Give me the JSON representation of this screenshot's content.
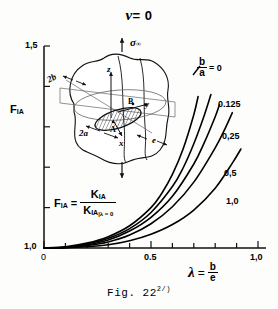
{
  "title_symbol": "ν",
  "title_rest": "= 0",
  "caption": "Fig. 22",
  "caption_superscript": "2/)",
  "axes": {
    "y_label": "F",
    "y_label_sub": "IA",
    "y_top_tick": "1,5",
    "y_bottom_tick": "1,0",
    "x_zero_tick": "0",
    "x_half_tick": "0.5",
    "x_one_tick": "1,0",
    "x_label_symbol": "λ",
    "x_label_eq": "=",
    "x_label_num": "b",
    "x_label_den": "e"
  },
  "formula": {
    "lhs": "F",
    "lhs_sub": "IA",
    "eq": "=",
    "num": "K",
    "num_sub": "IA",
    "den": "K",
    "den_sub": "IA",
    "den_cond": "λ = 0"
  },
  "curve_legend": {
    "ratio_num": "b",
    "ratio_den": "a",
    "ratio_eq": "= 0"
  },
  "inset": {
    "sigma": "σ",
    "sigma_sub": "∞",
    "label_2b": "2b",
    "label_2a": "2a",
    "label_e": "e",
    "label_x": "x",
    "label_y": "y",
    "label_z": "z",
    "point_a": "A",
    "point_b": "B"
  },
  "chart_data": {
    "type": "line",
    "xlabel": "λ = b/e",
    "ylabel": "F_IA",
    "xlim": [
      0,
      1.0
    ],
    "ylim": [
      1.0,
      1.5
    ],
    "grid": false,
    "legend_position": "inline-right",
    "x_ticks": [
      0,
      0.1,
      0.2,
      0.3,
      0.4,
      0.5,
      0.6,
      0.7,
      0.8,
      0.9,
      1.0
    ],
    "x_tick_labels": [
      "0",
      "",
      "",
      "",
      "",
      "0.5",
      "",
      "",
      "",
      "",
      "1,0"
    ],
    "y_ticks": [
      1.0,
      1.1,
      1.2,
      1.3,
      1.4,
      1.5
    ],
    "y_tick_labels": [
      "1,0",
      "",
      "",
      "",
      "",
      "1,5"
    ],
    "series": [
      {
        "name": "b/a = 0",
        "label": "0",
        "x": [
          0,
          0.1,
          0.2,
          0.3,
          0.4,
          0.5,
          0.55,
          0.6,
          0.65,
          0.7,
          0.72
        ],
        "values": [
          1.0,
          1.003,
          1.012,
          1.028,
          1.055,
          1.1,
          1.135,
          1.182,
          1.245,
          1.33,
          1.375
        ]
      },
      {
        "name": "b/a = 0.125",
        "label": "0.125",
        "x": [
          0,
          0.1,
          0.2,
          0.3,
          0.4,
          0.5,
          0.6,
          0.65,
          0.7,
          0.75,
          0.78
        ],
        "values": [
          1.0,
          1.002,
          1.01,
          1.024,
          1.048,
          1.088,
          1.152,
          1.198,
          1.258,
          1.33,
          1.38
        ]
      },
      {
        "name": "b/a = 0.25",
        "label": "0,25",
        "x": [
          0,
          0.1,
          0.2,
          0.3,
          0.4,
          0.5,
          0.6,
          0.7,
          0.75,
          0.8,
          0.82
        ],
        "values": [
          1.0,
          1.002,
          1.008,
          1.02,
          1.042,
          1.076,
          1.128,
          1.208,
          1.262,
          1.325,
          1.355
        ]
      },
      {
        "name": "b/a = 0.5",
        "label": "0,5",
        "x": [
          0,
          0.1,
          0.2,
          0.3,
          0.4,
          0.5,
          0.6,
          0.7,
          0.8,
          0.85,
          0.88
        ],
        "values": [
          1.0,
          1.001,
          1.006,
          1.015,
          1.032,
          1.06,
          1.102,
          1.163,
          1.248,
          1.3,
          1.335
        ]
      },
      {
        "name": "b/a = 1.0",
        "label": "1,0",
        "x": [
          0,
          0.1,
          0.2,
          0.3,
          0.4,
          0.5,
          0.6,
          0.7,
          0.8,
          0.88,
          0.92
        ],
        "values": [
          1.0,
          1.0005,
          1.003,
          1.008,
          1.018,
          1.034,
          1.058,
          1.094,
          1.148,
          1.21,
          1.245
        ]
      }
    ]
  }
}
